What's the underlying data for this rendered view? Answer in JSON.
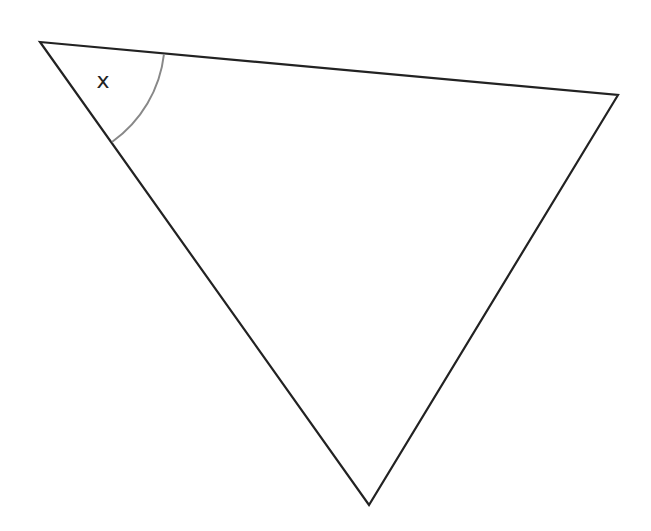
{
  "diagram": {
    "type": "triangle",
    "vertices": {
      "left": [
        40,
        42
      ],
      "right": [
        618,
        95
      ],
      "bottom": [
        369,
        505
      ]
    },
    "angle_label": {
      "text": "x",
      "at_vertex": "left",
      "position": [
        103,
        80
      ]
    },
    "arc": {
      "radius": 125,
      "start": [
        164,
        54
      ],
      "end": [
        112,
        142
      ]
    },
    "colors": {
      "stroke": "#222222",
      "arc": "#888888",
      "background": "#ffffff"
    }
  }
}
